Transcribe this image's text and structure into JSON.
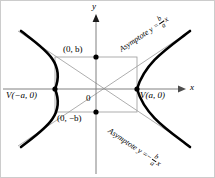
{
  "figure": {
    "type": "hyperbola-diagram",
    "title": "",
    "axes": {
      "x_label": "x",
      "y_label": "y",
      "origin_label": "0"
    },
    "points": [
      {
        "name": "vertex-left",
        "label": "V(−a, 0)",
        "x": -1,
        "y": 0
      },
      {
        "name": "vertex-right",
        "label": "V(a, 0)",
        "x": 1,
        "y": 0
      },
      {
        "name": "co-vertex-top",
        "label": "(0, b)",
        "x": 0,
        "y": 1
      },
      {
        "name": "co-vertex-bottom",
        "label": "(0, −b)",
        "x": 0,
        "y": -1
      }
    ],
    "asymptotes": [
      {
        "name": "asymptote-upper",
        "prefix": "Asymptote y =",
        "numerator": "b",
        "denominator": "a",
        "suffix": "x",
        "sign": "",
        "slope": "b/a"
      },
      {
        "name": "asymptote-lower",
        "prefix": "Asymptote y =",
        "numerator": "b",
        "denominator": "a",
        "suffix": "x",
        "sign": "−",
        "slope": "-b/a"
      }
    ],
    "colors": {
      "curve": "#000000",
      "axis": "#808080",
      "rectangle": "#999999",
      "asymptote_line": "#999999",
      "background": "#ffffff"
    }
  }
}
